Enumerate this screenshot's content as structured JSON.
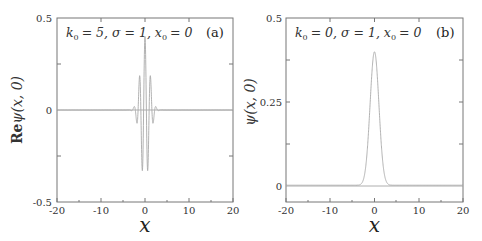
{
  "chart_data": [
    {
      "type": "line",
      "panel": "(a)",
      "annotation": "k₀ = 5,  σ = 1,  x₀ = 0",
      "title": "",
      "xlabel": "x",
      "ylabel": "Re ψ(x, 0)",
      "xlim": [
        -20,
        20
      ],
      "ylim": [
        -0.5,
        0.5
      ],
      "xticks": [
        "-20",
        "-10",
        "0",
        "10",
        "20"
      ],
      "yticks": [
        "0.5",
        "0",
        "-0.5"
      ],
      "function": "Re psi = (1/sqrt(2*pi)) * exp(-x^2/2) * cos(5x)",
      "params": {
        "k0": 5,
        "sigma": 1,
        "x0": 0
      },
      "series": [
        {
          "name": "Re psi(x,0)",
          "x": [
            -4,
            -3,
            -2.5,
            -2,
            -1.5,
            -1,
            -0.6,
            -0.3,
            0,
            0.3,
            0.6,
            1,
            1.5,
            2,
            2.5,
            3,
            4
          ],
          "values": [
            0.0,
            0.008,
            -0.02,
            0.045,
            0.09,
            0.07,
            -0.36,
            0.0,
            0.399,
            0.0,
            -0.36,
            0.07,
            0.09,
            0.045,
            -0.02,
            0.008,
            0.0
          ]
        }
      ],
      "grid": false,
      "line_color": "#aaaaaa"
    },
    {
      "type": "line",
      "panel": "(b)",
      "annotation": "k₀ = 0,  σ = 1,  x₀ = 0",
      "title": "",
      "xlabel": "x",
      "ylabel": "ψ(x, 0)",
      "xlim": [
        -20,
        20
      ],
      "ylim": [
        -0.05,
        0.5
      ],
      "xticks": [
        "-20",
        "-10",
        "0",
        "10",
        "20"
      ],
      "yticks": [
        "0.5",
        "0.25",
        "0"
      ],
      "function": "psi = (1/sqrt(2*pi)) * exp(-x^2/2)",
      "params": {
        "k0": 0,
        "sigma": 1,
        "x0": 0
      },
      "series": [
        {
          "name": "psi(x,0)",
          "x": [
            -5,
            -4,
            -3,
            -2,
            -1,
            0,
            1,
            2,
            3,
            4,
            5
          ],
          "values": [
            0.0,
            0.0001,
            0.0044,
            0.054,
            0.242,
            0.399,
            0.242,
            0.054,
            0.0044,
            0.0001,
            0.0
          ]
        }
      ],
      "grid": false,
      "line_color": "#aaaaaa"
    }
  ],
  "panels": {
    "a": {
      "tag": "(a)",
      "annotation_k": "k",
      "annotation_k_sub": "0",
      "annotation_text": "= 5,  σ = 1,  x",
      "annotation_x_sub": "0",
      "annotation_end": "= 0",
      "ylabel_re": "Re",
      "ylabel_psi": "ψ(x, 0)",
      "xlabel": "x",
      "yticks": {
        "top": "0.5",
        "mid": "0",
        "bottom": "-0.5"
      },
      "xticks": [
        "-20",
        "-10",
        "0",
        "10",
        "20"
      ]
    },
    "b": {
      "tag": "(b)",
      "annotation_k": "k",
      "annotation_k_sub": "0",
      "annotation_text": "= 0,  σ = 1,  x",
      "annotation_x_sub": "0",
      "annotation_end": "= 0",
      "ylabel_psi": "ψ(x, 0)",
      "xlabel": "x",
      "yticks": {
        "top": "0.5",
        "mid": "0.25",
        "zero": "0"
      },
      "xticks": [
        "-20",
        "-10",
        "0",
        "10",
        "20"
      ]
    }
  }
}
